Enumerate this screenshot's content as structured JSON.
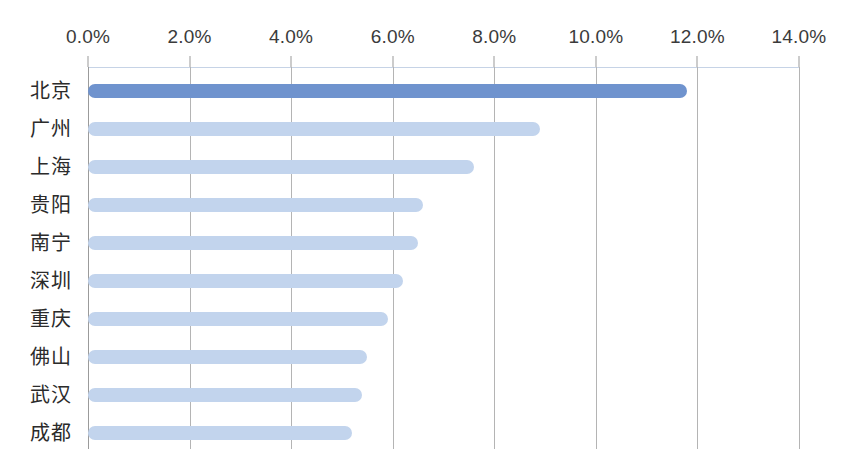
{
  "chart_data": {
    "type": "bar",
    "orientation": "horizontal",
    "title": "",
    "subtitle": "",
    "xlabel": "",
    "ylabel": "",
    "xlim": [
      0.0,
      14.0
    ],
    "xunit": "%",
    "grid": true,
    "legend": false,
    "legend_position": "none",
    "categories": [
      "北京",
      "广州",
      "上海",
      "贵阳",
      "南宁",
      "深圳",
      "重庆",
      "佛山",
      "武汉",
      "成都"
    ],
    "values": [
      11.8,
      8.9,
      7.6,
      6.6,
      6.5,
      6.2,
      5.9,
      5.5,
      5.4,
      5.2
    ],
    "value_labels": [
      "11.8%",
      "8.9%",
      "7.6%",
      "6.6%",
      "6.5%",
      "6.2%",
      "5.9%",
      "5.5%",
      "5.4%",
      "5.2%"
    ],
    "xticks": [
      0.0,
      2.0,
      4.0,
      6.0,
      8.0,
      10.0,
      12.0,
      14.0
    ],
    "xtick_labels": [
      "0.0%",
      "2.0%",
      "4.0%",
      "6.0%",
      "8.0%",
      "10.0%",
      "12.0%",
      "14.0%"
    ],
    "highlight_index": 0,
    "colors": {
      "bar": "#c2d4ed",
      "bar_highlight": "#6f93ce",
      "gridline": "#b4b4b4",
      "axis": "#9b9b9b",
      "top_rule": "#c6d3e6",
      "tick_label": "#3b3b3b",
      "category_label": "#2b2b2b",
      "background": "#ffffff"
    }
  }
}
